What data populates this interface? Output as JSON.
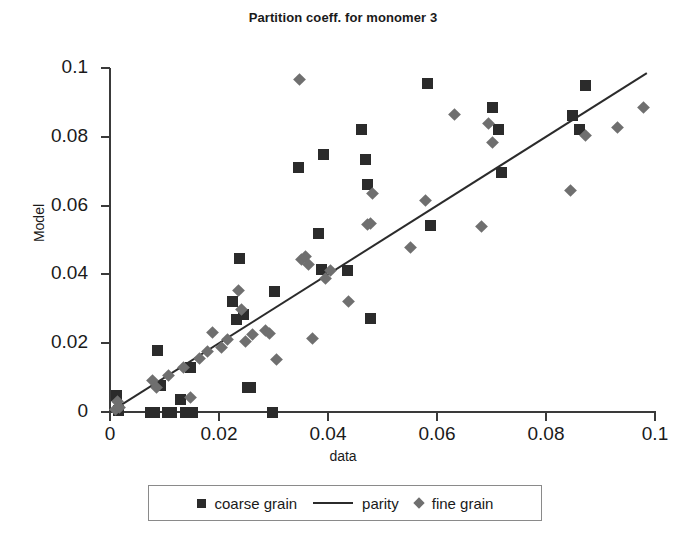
{
  "chart": {
    "title": "Partition coeff. for monomer 3",
    "xlabel": "data",
    "ylabel": "Model"
  },
  "legend": {
    "entries": [
      {
        "label": "coarse grain",
        "marker": "square-marker-icon",
        "color": "#2b2b2b"
      },
      {
        "label": "parity",
        "marker": "line-marker-icon",
        "color": "#2b2b2b"
      },
      {
        "label": "fine grain",
        "marker": "diamond-marker-icon",
        "color": "#6f6f6f"
      }
    ]
  },
  "axes": {
    "x_ticks": [
      "0",
      "0.02",
      "0.04",
      "0.06",
      "0.08",
      "0.1"
    ],
    "y_ticks": [
      "0",
      "0.02",
      "0.04",
      "0.06",
      "0.08",
      "0.1"
    ]
  },
  "chart_data": {
    "type": "scatter",
    "title": "Partition coeff. for monomer 3",
    "xlabel": "data",
    "ylabel": "Model",
    "xlim": [
      0,
      0.1
    ],
    "ylim": [
      0,
      0.1
    ],
    "xticks": [
      0,
      0.02,
      0.04,
      0.06,
      0.08,
      0.1
    ],
    "yticks": [
      0,
      0.02,
      0.04,
      0.06,
      0.08,
      0.1
    ],
    "grid": false,
    "legend_position": "bottom",
    "series": [
      {
        "name": "coarse grain",
        "type": "scatter",
        "marker": "square",
        "color": "#2b2b2b",
        "points": [
          [
            0.0012,
            0.0048
          ],
          [
            0.0015,
            0.0005
          ],
          [
            0.0075,
            0.0
          ],
          [
            0.0082,
            0.0
          ],
          [
            0.0088,
            0.018
          ],
          [
            0.0092,
            0.0078
          ],
          [
            0.0105,
            0.0
          ],
          [
            0.0112,
            0.0
          ],
          [
            0.013,
            0.0035
          ],
          [
            0.0138,
            0.0
          ],
          [
            0.0148,
            0.0128
          ],
          [
            0.0152,
            0.0
          ],
          [
            0.0225,
            0.032
          ],
          [
            0.0232,
            0.0268
          ],
          [
            0.0238,
            0.0445
          ],
          [
            0.0245,
            0.0282
          ],
          [
            0.0252,
            0.007
          ],
          [
            0.0258,
            0.007
          ],
          [
            0.0298,
            0.0
          ],
          [
            0.0302,
            0.035
          ],
          [
            0.0345,
            0.071
          ],
          [
            0.0382,
            0.052
          ],
          [
            0.0388,
            0.0415
          ],
          [
            0.0392,
            0.075
          ],
          [
            0.0435,
            0.041
          ],
          [
            0.0462,
            0.0822
          ],
          [
            0.0468,
            0.0735
          ],
          [
            0.0472,
            0.066
          ],
          [
            0.0478,
            0.0272
          ],
          [
            0.0582,
            0.0955
          ],
          [
            0.0588,
            0.0542
          ],
          [
            0.0702,
            0.0885
          ],
          [
            0.0712,
            0.082
          ],
          [
            0.0718,
            0.0695
          ],
          [
            0.0848,
            0.0862
          ],
          [
            0.0862,
            0.082
          ],
          [
            0.0872,
            0.095
          ]
        ]
      },
      {
        "name": "fine grain",
        "type": "scatter",
        "marker": "diamond",
        "color": "#6f6f6f",
        "points": [
          [
            0.001,
            0.0008
          ],
          [
            0.0014,
            0.003
          ],
          [
            0.0018,
            0.0012
          ],
          [
            0.0078,
            0.0092
          ],
          [
            0.0085,
            0.0072
          ],
          [
            0.0108,
            0.0105
          ],
          [
            0.0135,
            0.0128
          ],
          [
            0.0148,
            0.0042
          ],
          [
            0.0165,
            0.0155
          ],
          [
            0.0178,
            0.0175
          ],
          [
            0.0188,
            0.0232
          ],
          [
            0.0205,
            0.0188
          ],
          [
            0.0215,
            0.021
          ],
          [
            0.0235,
            0.0352
          ],
          [
            0.0242,
            0.0298
          ],
          [
            0.0248,
            0.0205
          ],
          [
            0.0262,
            0.0225
          ],
          [
            0.0285,
            0.0238
          ],
          [
            0.0292,
            0.0228
          ],
          [
            0.0305,
            0.0152
          ],
          [
            0.0348,
            0.0968
          ],
          [
            0.0352,
            0.0442
          ],
          [
            0.0358,
            0.0452
          ],
          [
            0.0365,
            0.0428
          ],
          [
            0.0372,
            0.0215
          ],
          [
            0.0395,
            0.0388
          ],
          [
            0.0405,
            0.041
          ],
          [
            0.0438,
            0.0322
          ],
          [
            0.0472,
            0.0545
          ],
          [
            0.0478,
            0.0548
          ],
          [
            0.0482,
            0.0635
          ],
          [
            0.0552,
            0.0478
          ],
          [
            0.0578,
            0.0615
          ],
          [
            0.0632,
            0.0865
          ],
          [
            0.0682,
            0.0538
          ],
          [
            0.0695,
            0.0838
          ],
          [
            0.0702,
            0.0782
          ],
          [
            0.0845,
            0.0645
          ],
          [
            0.0872,
            0.0805
          ],
          [
            0.0932,
            0.0828
          ],
          [
            0.0978,
            0.0885
          ]
        ]
      },
      {
        "name": "parity",
        "type": "line",
        "color": "#2b2b2b",
        "points": [
          [
            0.0,
            0.0
          ],
          [
            0.0985,
            0.0985
          ]
        ]
      }
    ]
  }
}
